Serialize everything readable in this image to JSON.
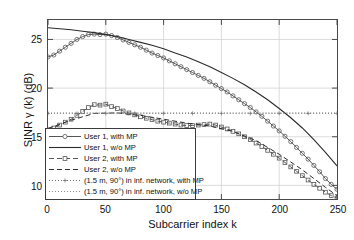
{
  "chart_data": {
    "type": "line",
    "title": "",
    "xlabel": "Subcarrier index k",
    "ylabel": "SINR γ (k) (dB)",
    "xlim": [
      0,
      250
    ],
    "ylim": [
      8.6,
      27.0
    ],
    "xticks": [
      0,
      50,
      100,
      150,
      200,
      250
    ],
    "yticks": [
      10,
      15,
      20,
      25
    ],
    "grid": true,
    "legend_position": "lower-left-inside",
    "series": [
      {
        "name": "User 1, with MP",
        "style": "solid-circle-markers",
        "color": "#555555",
        "x": [
          0,
          5,
          10,
          15,
          20,
          25,
          30,
          35,
          40,
          45,
          50,
          55,
          60,
          65,
          70,
          75,
          80,
          85,
          90,
          95,
          100,
          105,
          110,
          115,
          120,
          125,
          130,
          135,
          140,
          145,
          150,
          155,
          160,
          165,
          170,
          175,
          180,
          185,
          190,
          195,
          200,
          205,
          210,
          215,
          220,
          225,
          230,
          235,
          240,
          245,
          250
        ],
        "y": [
          23.2,
          23.4,
          23.8,
          24.2,
          24.6,
          25.0,
          25.3,
          25.5,
          25.55,
          25.5,
          25.55,
          25.4,
          25.2,
          24.95,
          24.7,
          24.45,
          24.2,
          23.9,
          23.6,
          23.35,
          23.1,
          22.8,
          22.5,
          22.2,
          21.9,
          21.6,
          21.3,
          21.0,
          20.65,
          20.3,
          19.95,
          19.6,
          19.2,
          18.8,
          18.4,
          18.0,
          17.55,
          17.1,
          16.6,
          16.1,
          15.6,
          15.05,
          14.5,
          13.9,
          13.3,
          12.7,
          12.05,
          11.4,
          10.7,
          10.1,
          9.6
        ]
      },
      {
        "name": "User 1, w/o MP",
        "style": "solid",
        "color": "#2b2b2b",
        "x": [
          0,
          10,
          20,
          30,
          40,
          50,
          60,
          70,
          80,
          90,
          100,
          110,
          120,
          130,
          140,
          150,
          160,
          170,
          180,
          190,
          200,
          210,
          220,
          230,
          240,
          250
        ],
        "y": [
          26.2,
          26.1,
          26.0,
          25.85,
          25.7,
          25.5,
          25.3,
          25.0,
          24.7,
          24.4,
          24.05,
          23.6,
          23.2,
          22.7,
          22.2,
          21.6,
          21.0,
          20.35,
          19.6,
          18.8,
          17.9,
          16.95,
          15.9,
          14.7,
          13.4,
          12.0
        ]
      },
      {
        "name": "User 2, with MP",
        "style": "dashed-square-markers",
        "color": "#555555",
        "x": [
          0,
          5,
          10,
          15,
          20,
          25,
          30,
          35,
          40,
          45,
          50,
          55,
          60,
          65,
          70,
          75,
          80,
          85,
          90,
          95,
          100,
          105,
          110,
          115,
          120,
          125,
          130,
          135,
          140,
          145,
          150,
          155,
          160,
          165,
          170,
          175,
          180,
          185,
          190,
          195,
          200,
          205,
          210,
          215,
          220,
          225,
          230,
          235,
          240,
          245,
          250
        ],
        "y": [
          15.7,
          15.9,
          16.2,
          16.5,
          16.8,
          17.2,
          17.6,
          18.0,
          18.3,
          18.25,
          18.35,
          18.1,
          17.9,
          17.65,
          17.45,
          17.25,
          17.05,
          16.9,
          16.75,
          16.6,
          16.5,
          16.4,
          16.3,
          16.2,
          16.15,
          16.15,
          16.2,
          16.25,
          16.3,
          16.2,
          16.0,
          15.8,
          15.55,
          15.3,
          15.0,
          14.7,
          14.35,
          14.0,
          13.6,
          13.2,
          12.8,
          12.35,
          11.9,
          11.45,
          11.0,
          10.55,
          10.1,
          9.7,
          9.3,
          8.95,
          8.7
        ]
      },
      {
        "name": "User 2, w/o MP",
        "style": "dashed",
        "color": "#2b2b2b",
        "x": [
          0,
          20,
          40,
          60,
          80,
          100,
          120,
          140,
          160,
          180,
          200,
          220,
          240,
          250
        ],
        "y": [
          15.85,
          16.7,
          17.4,
          17.45,
          17.2,
          16.8,
          16.4,
          16.1,
          15.55,
          14.6,
          13.2,
          11.6,
          9.8,
          8.95
        ]
      },
      {
        "name": "(1.5 m, 90°) in inf. network, with MP",
        "style": "dotted-plus-markers",
        "color": "#777777",
        "x": [
          0,
          25,
          50,
          75,
          100,
          125,
          150,
          175,
          200,
          225,
          250
        ],
        "y": [
          17.4,
          17.4,
          17.4,
          17.4,
          17.4,
          17.4,
          17.4,
          17.4,
          17.4,
          17.4,
          17.4
        ]
      },
      {
        "name": "(1.5 m, 90°) in inf. network, w/o MP",
        "style": "dotted",
        "color": "#888888",
        "x": [
          0,
          50,
          100,
          150,
          200,
          250
        ],
        "y": [
          17.45,
          17.45,
          17.45,
          17.45,
          17.45,
          17.45
        ]
      }
    ],
    "legend_entries": [
      "User 1, with MP",
      "User 1, w/o MP",
      "User 2, with MP",
      "User 2, w/o MP",
      "(1.5 m, 90°) in inf. network, with MP",
      "(1.5 m, 90°) in inf. network, w/o MP"
    ],
    "colors": {
      "axis": "#4a4a4a",
      "grid": "#d2d2d2",
      "marker_line": "#555555",
      "solid_line": "#2b2b2b",
      "dotted_line": "#888888",
      "background": "#ffffff"
    }
  }
}
